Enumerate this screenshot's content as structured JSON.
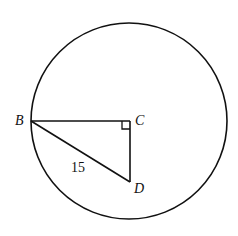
{
  "diagram": {
    "labels": {
      "B": "B",
      "C": "C",
      "D": "D",
      "hypotenuse": "15"
    },
    "colors": {
      "stroke": "#111111",
      "background": "#ffffff"
    }
  }
}
